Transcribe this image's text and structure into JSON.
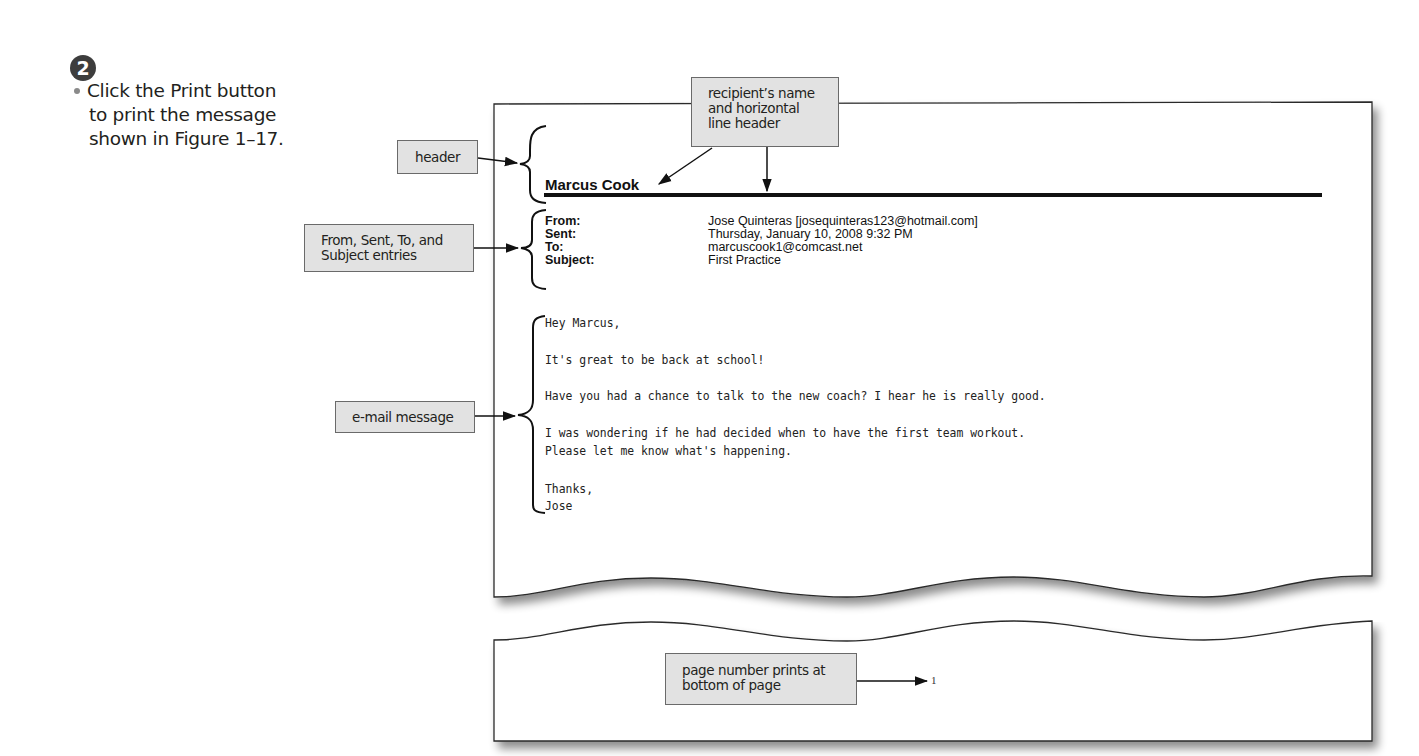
{
  "step": {
    "number": "2",
    "instruction_lines": [
      "Click the Print button",
      "to print the message",
      "shown in Figure 1–17."
    ]
  },
  "callouts": {
    "recipient": [
      "recipient’s name",
      "and horizontal",
      "line header"
    ],
    "header": [
      "header"
    ],
    "entries": [
      "From, Sent, To, and",
      "Subject entries"
    ],
    "message": [
      "e-mail message"
    ],
    "page_number": [
      "page number prints at",
      "bottom of page"
    ]
  },
  "printout": {
    "recipient_name": "Marcus Cook",
    "header_fields": [
      {
        "label": "From:",
        "value": "Jose Quinteras [josequinteras123@hotmail.com]"
      },
      {
        "label": "Sent:",
        "value": "Thursday, January 10, 2008 9:32 PM"
      },
      {
        "label": "To:",
        "value": "marcuscook1@comcast.net"
      },
      {
        "label": "Subject:",
        "value": "First Practice"
      }
    ],
    "body_lines": [
      "Hey Marcus,",
      "It's great to be back at school!",
      "Have you had a chance to talk to the new coach? I hear he is really good.",
      "I was wondering if he had decided when to have the first team workout.",
      "Please let me know what's happening.",
      "Thanks,",
      "Jose"
    ],
    "page_number": "1"
  },
  "colors": {
    "callout_fill": "#e2e2e2",
    "callout_border": "#6a6a6a",
    "page_border": "#2a2a2a",
    "badge": "#3d3d3d"
  }
}
